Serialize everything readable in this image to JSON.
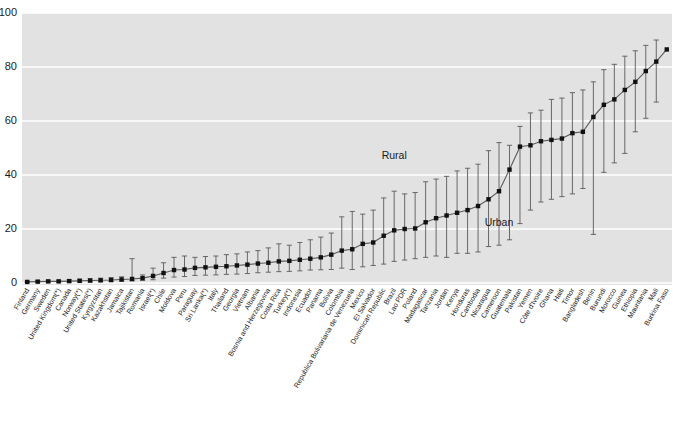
{
  "chart_data": {
    "type": "line",
    "title": "",
    "subtitle": "",
    "xlabel": "",
    "ylabel": "",
    "ylim": [
      0,
      100
    ],
    "yticks": [
      0,
      20,
      40,
      60,
      80,
      100
    ],
    "ytick_labels": [
      "0",
      "20",
      "40",
      "60",
      "80",
      "100"
    ],
    "grid": "horizontal",
    "legend_position": "none",
    "plot_background": "#e2e2e2",
    "marker_color": "#111111",
    "line_color": "#5a5a5a",
    "errorbar_color": "#5a5a5a",
    "grid_color": "#ffffff",
    "annotations": [
      {
        "text": "Rural",
        "x_category": "Brazil",
        "y_value": 46
      },
      {
        "text": "Urban",
        "x_category": "Cameroon",
        "y_value": 21
      }
    ],
    "series": [
      {
        "name": "National",
        "marker": "square",
        "categories": [
          "Finland",
          "Germany",
          "Sweden",
          "United Kingdom(*)",
          "Canada",
          "Norway(*)",
          "United States(*)",
          "Kyrgyzstan",
          "Kazakhstan",
          "Jamaica",
          "Tajikistan",
          "Romania",
          "Israel(*)",
          "Chile",
          "Moldova",
          "Peru",
          "Paraguay",
          "Sri Lanka(*)",
          "Italy",
          "Thailand",
          "Georgia",
          "Vietnam",
          "Albania",
          "Bosnia and Herzegovina",
          "Costa Rica",
          "Turkey(*)",
          "Indonesia",
          "Ecuador",
          "Panama",
          "Bolivia",
          "Colombia",
          "Republica Bolivariana de Venezuela",
          "Mexico",
          "El Salvador",
          "Dominican Republic",
          "Brazil",
          "Lao PDR",
          "Poland",
          "Madagascar",
          "Tanzania",
          "Jordan",
          "Kenya",
          "Honduras",
          "Cambodia",
          "Nicaragua",
          "Cameroon",
          "Guatemala",
          "Pakistan",
          "Yemen",
          "Côte d'Ivoire",
          "Ghana",
          "Haiti",
          "Timor",
          "Bangladesh",
          "Benin",
          "Burundi",
          "Morocco",
          "Guinea",
          "Ethiopia",
          "Mauritania",
          "Mali",
          "Burkina Faso"
        ],
        "values": [
          0.4,
          0.5,
          0.6,
          0.6,
          0.7,
          0.8,
          0.9,
          1.0,
          1.1,
          1.3,
          1.5,
          1.8,
          2.6,
          3.7,
          4.8,
          5.0,
          5.6,
          5.8,
          6.0,
          6.2,
          6.5,
          6.8,
          7.2,
          7.5,
          8.0,
          8.2,
          8.6,
          9.0,
          9.5,
          10.5,
          12.0,
          12.5,
          14.5,
          15.0,
          17.5,
          19.5,
          20.0,
          20.2,
          22.5,
          24.0,
          25.0,
          26.0,
          27.0,
          28.5,
          31.0,
          34.0,
          42.0,
          50.5,
          51.0,
          52.5,
          53.0,
          53.5,
          55.5,
          56.0,
          61.5,
          66.0,
          68.0,
          71.5,
          74.5,
          78.5,
          82.0,
          86.5
        ],
        "lower": [
          0.2,
          0.2,
          0.3,
          0.3,
          0.3,
          0.4,
          0.4,
          0.5,
          0.6,
          0.7,
          0.8,
          1.0,
          1.2,
          1.8,
          2.2,
          2.4,
          2.8,
          2.9,
          3.0,
          3.2,
          3.3,
          3.5,
          3.8,
          4.0,
          4.2,
          4.3,
          4.5,
          4.8,
          4.9,
          5.0,
          5.5,
          5.0,
          6.0,
          6.5,
          7.0,
          8.0,
          8.5,
          9.0,
          9.5,
          10.0,
          9.5,
          11.0,
          11.0,
          11.5,
          13.5,
          14.0,
          16.0,
          22.0,
          27.0,
          30.0,
          31.0,
          32.0,
          33.0,
          35.0,
          18.0,
          41.0,
          44.5,
          48.0,
          56.0,
          61.0,
          67.0,
          86.5
        ],
        "upper": [
          0.7,
          0.9,
          1.0,
          1.0,
          1.2,
          1.4,
          1.6,
          1.8,
          2.0,
          2.3,
          9.0,
          3.0,
          5.5,
          7.5,
          9.5,
          10.0,
          9.5,
          9.8,
          10.0,
          10.5,
          10.8,
          11.5,
          12.0,
          13.0,
          14.5,
          14.0,
          15.0,
          16.0,
          17.0,
          18.5,
          24.5,
          26.5,
          25.5,
          27.0,
          31.5,
          34.0,
          33.0,
          33.5,
          37.5,
          38.5,
          39.5,
          41.5,
          42.5,
          44.0,
          49.0,
          52.0,
          51.0,
          58.0,
          63.0,
          64.0,
          68.0,
          68.5,
          70.5,
          71.5,
          74.5,
          79.0,
          81.0,
          84.0,
          86.0,
          88.0,
          90.0,
          86.5
        ]
      }
    ]
  },
  "axes": {
    "y_axis_name": "y-axis",
    "x_axis_name": "x-axis-categories"
  }
}
